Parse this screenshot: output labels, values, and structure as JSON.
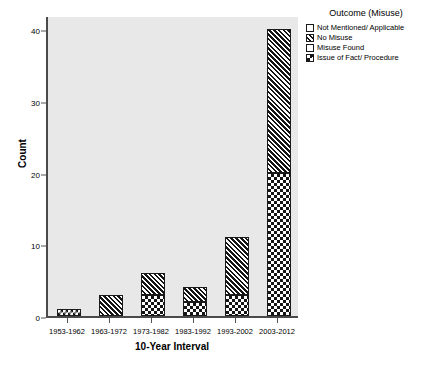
{
  "chart_data": {
    "type": "bar",
    "title": "",
    "xlabel": "10-Year Interval",
    "ylabel": "Count",
    "categories": [
      "1953-1962",
      "1963-1972",
      "1973-1982",
      "1983-1992",
      "1993-2002",
      "2003-2012"
    ],
    "ylim": [
      0,
      42
    ],
    "yticks": [
      0,
      10,
      20,
      30,
      40
    ],
    "grid": false,
    "stacked": true,
    "legend_position": "top-right",
    "legend_title": "Outcome (Misuse)",
    "series": [
      {
        "name": "Not Mentioned/ Applicable",
        "pattern": "empty",
        "values": [
          0,
          0,
          0,
          0,
          0,
          0
        ]
      },
      {
        "name": "No Misuse",
        "pattern": "hatch",
        "values": [
          0,
          3,
          3,
          2,
          8,
          20
        ]
      },
      {
        "name": "Misuse Found",
        "pattern": "empty",
        "values": [
          0,
          0,
          0,
          0,
          0,
          0
        ]
      },
      {
        "name": "Issue of Fact/ Procedure",
        "pattern": "check",
        "values": [
          1,
          0,
          3,
          2,
          3,
          20
        ]
      }
    ],
    "totals": [
      1,
      3,
      6,
      4,
      11,
      40
    ]
  },
  "colors": {
    "plot_background": "#e8e8e8",
    "axis": "#4a4a4a",
    "bar_outline": "#1a1a1a",
    "pattern_dark": "#151515",
    "pattern_light": "#ffffff",
    "page_background": "#ffffff"
  }
}
